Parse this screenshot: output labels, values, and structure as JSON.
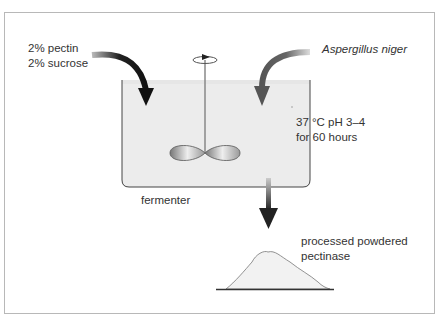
{
  "diagram": {
    "inputs": {
      "nutrients": [
        "2% pectin",
        "2% sucrose"
      ],
      "organism": "Aspergillus niger"
    },
    "vessel_label": "fermenter",
    "conditions": [
      "37 °C pH 3–4",
      "for 60 hours"
    ],
    "product": [
      "processed powdered",
      "pectinase"
    ],
    "colors": {
      "tank_fill": "#ececec",
      "arrow_dark": "#1a1a1a",
      "arrow_grey": "#555555",
      "frame": "#b8b8b8"
    }
  }
}
